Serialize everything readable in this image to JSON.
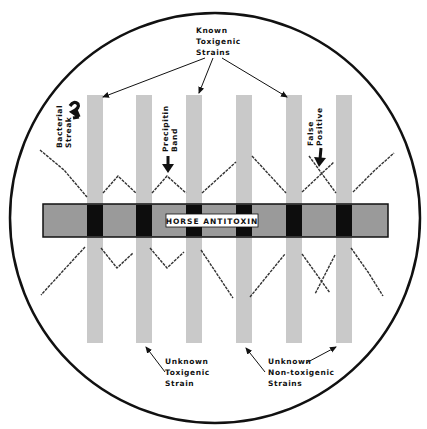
{
  "diagram": {
    "type": "Elek immunodiffusion plate",
    "colors": {
      "plate_outline": "#111111",
      "strip": "#c9c9c9",
      "antitoxin_band": "#9a9a9a",
      "intersection": "#0d0d0d",
      "precipitin_line": "#333333",
      "background": "#ffffff"
    },
    "antitoxin_band_label": "HORSE ANTITOXIN",
    "strips": [
      {
        "id": 1,
        "group": "known-toxigenic"
      },
      {
        "id": 2,
        "group": "unknown-toxigenic"
      },
      {
        "id": 3,
        "group": "known-toxigenic"
      },
      {
        "id": 4,
        "group": "unknown-non-toxigenic"
      },
      {
        "id": 5,
        "group": "known-toxigenic"
      },
      {
        "id": 6,
        "group": "unknown-non-toxigenic"
      }
    ],
    "labels": {
      "known_toxigenic": [
        "Known",
        "Toxigenic",
        "Strains"
      ],
      "bacterial_streak": [
        "Bacterial",
        "Streak"
      ],
      "precipitin_band": [
        "Precipitin",
        "Band"
      ],
      "false_positive": [
        "False",
        "Positive"
      ],
      "unknown_toxigenic": [
        "Unknown",
        "Toxigenic",
        "Strain"
      ],
      "unknown_non_toxigenic": [
        "Unknown",
        "Non-toxigenic",
        "Strains"
      ]
    }
  }
}
